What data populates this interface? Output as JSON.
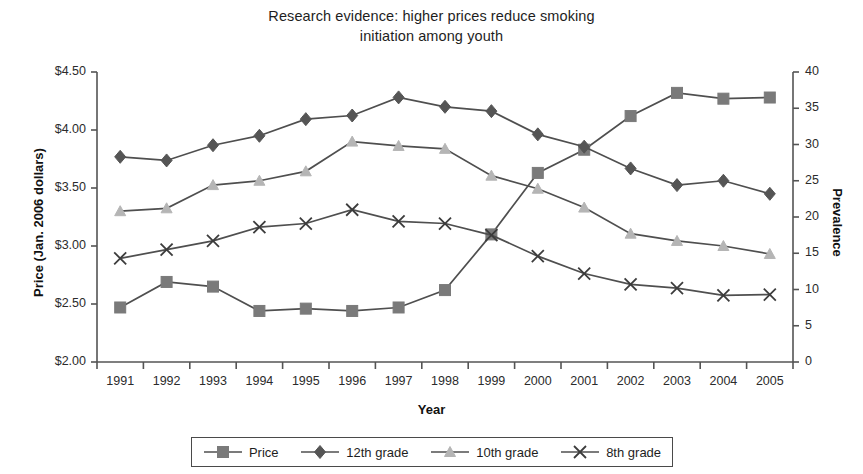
{
  "title": {
    "line1": "Research evidence: higher prices reduce smoking",
    "line2": "initiation among youth"
  },
  "axes": {
    "x_title": "Year",
    "y_left_title": "Price (Jan. 2006 dollars)",
    "y_right_title": "Prevalence",
    "x_tick_labels": [
      "1991",
      "1992",
      "1993",
      "1994",
      "1995",
      "1996",
      "1997",
      "1998",
      "1999",
      "2000",
      "2001",
      "2002",
      "2003",
      "2004",
      "2005"
    ],
    "y_left_tick_labels": [
      "$4.50",
      "$4.00",
      "$3.50",
      "$3.00",
      "$2.50",
      "$2.00"
    ],
    "y_right_tick_labels": [
      "40",
      "35",
      "30",
      "25",
      "20",
      "15",
      "10",
      "5",
      "0"
    ]
  },
  "legend": {
    "items": [
      {
        "label": "Price",
        "marker": "square-marker-icon",
        "color": "#7a7a7a"
      },
      {
        "label": "12th grade",
        "marker": "diamond-marker-icon",
        "color": "#555555"
      },
      {
        "label": "10th grade",
        "marker": "triangle-marker-icon",
        "color": "#b5b5b5"
      },
      {
        "label": "8th grade",
        "marker": "cross-marker-icon",
        "color": "#3c3c3c"
      }
    ]
  },
  "chart_data": {
    "type": "line",
    "title": "Research evidence: higher prices reduce smoking initiation among youth",
    "xlabel": "Year",
    "ylabel": "Price (Jan. 2006 dollars)",
    "y2label": "Prevalence",
    "x": [
      1991,
      1992,
      1993,
      1994,
      1995,
      1996,
      1997,
      1998,
      1999,
      2000,
      2001,
      2002,
      2003,
      2004,
      2005
    ],
    "xlim": [
      1990.5,
      2005.5
    ],
    "ylim": [
      2.0,
      4.5
    ],
    "y2lim": [
      0,
      40
    ],
    "yticks": [
      2.0,
      2.5,
      3.0,
      3.5,
      4.0,
      4.5
    ],
    "y2ticks": [
      0,
      5,
      10,
      15,
      20,
      25,
      30,
      35,
      40
    ],
    "grid": false,
    "legend_position": "below",
    "series": [
      {
        "name": "Price",
        "axis": "left",
        "marker": "square",
        "color": "#7a7a7a",
        "line_color": "#4f4f4f",
        "values": [
          2.47,
          2.69,
          2.65,
          2.44,
          2.46,
          2.44,
          2.47,
          2.62,
          3.1,
          3.63,
          3.83,
          4.12,
          4.32,
          4.27,
          4.28
        ]
      },
      {
        "name": "12th grade",
        "axis": "right",
        "marker": "diamond",
        "color": "#555555",
        "line_color": "#4f4f4f",
        "values": [
          28.3,
          27.8,
          29.9,
          31.2,
          33.5,
          34.0,
          36.5,
          35.2,
          34.6,
          31.4,
          29.7,
          26.7,
          24.4,
          25.0,
          23.2
        ]
      },
      {
        "name": "10th grade",
        "axis": "right",
        "marker": "triangle",
        "color": "#b5b5b5",
        "line_color": "#4f4f4f",
        "values": [
          20.8,
          21.2,
          24.4,
          25.0,
          26.3,
          30.4,
          29.8,
          29.4,
          25.7,
          23.9,
          21.3,
          17.7,
          16.7,
          16.0,
          14.9
        ]
      },
      {
        "name": "8th grade",
        "axis": "right",
        "marker": "cross",
        "color": "#3c3c3c",
        "line_color": "#4f4f4f",
        "values": [
          14.3,
          15.5,
          16.7,
          18.6,
          19.1,
          21.0,
          19.4,
          19.1,
          17.5,
          14.6,
          12.2,
          10.7,
          10.2,
          9.2,
          9.3
        ]
      }
    ]
  }
}
